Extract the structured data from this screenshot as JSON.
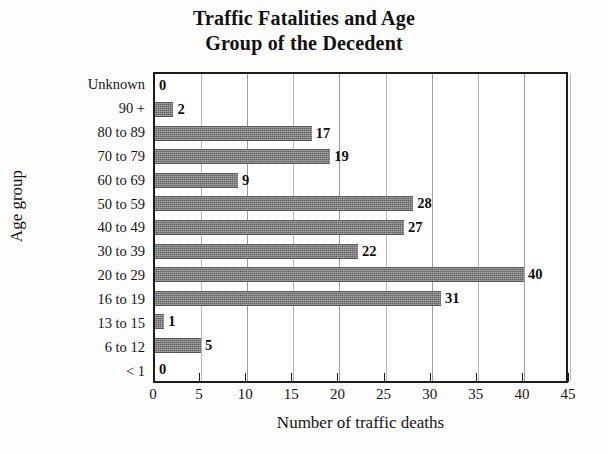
{
  "chart_data": {
    "type": "bar",
    "orientation": "horizontal",
    "title": "Traffic Fatalities and Age Group of the Decedent",
    "title_lines": [
      "Traffic Fatalities and Age",
      "Group of the Decedent"
    ],
    "xlabel": "Number of traffic deaths",
    "ylabel": "Age group",
    "categories": [
      "Unknown",
      "90 +",
      "80 to 89",
      "70 to 79",
      "60 to 69",
      "50 to 59",
      "40 to 49",
      "30 to 39",
      "20 to 29",
      "16 to 19",
      "13 to 15",
      "6 to 12",
      "< 1"
    ],
    "values": [
      0,
      2,
      17,
      19,
      9,
      28,
      27,
      22,
      40,
      31,
      1,
      5,
      0
    ],
    "value_labels": [
      "0",
      "2",
      "17",
      "19",
      "9",
      "28",
      "27",
      "22",
      "40",
      "31",
      "1",
      "5",
      "0"
    ],
    "xlim": [
      0,
      45
    ],
    "xticks": [
      0,
      5,
      10,
      15,
      20,
      25,
      30,
      35,
      40,
      45
    ],
    "xtick_labels": [
      "0",
      "5",
      "10",
      "15",
      "20",
      "25",
      "30",
      "35",
      "40",
      "45"
    ],
    "grid": "vertical",
    "legend": "none",
    "bar_color": "#7b7b7b",
    "axis_color": "#1d1d1d",
    "gridline_color": "#b9b9b9",
    "background_color": "#ffffff"
  }
}
